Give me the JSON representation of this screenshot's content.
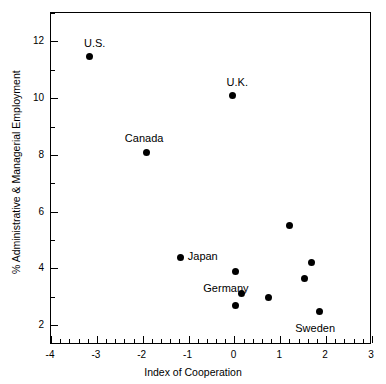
{
  "chart_data": {
    "type": "scatter",
    "title": "",
    "xlabel": "Index of Cooperation",
    "ylabel": "% Administrative & Managerial Employment",
    "xlim": [
      -4,
      3
    ],
    "ylim": [
      1.3,
      13.0
    ],
    "grid": false,
    "legend": "none",
    "x_major_ticks": [
      -4,
      -3,
      -2,
      -1,
      0,
      1,
      2,
      3
    ],
    "x_major_tick_labels": [
      "-4",
      "-3",
      "-2",
      "-1",
      "0",
      "1",
      "2",
      "3"
    ],
    "x_minor_tick_step": 0.2,
    "y_major_ticks": [
      2,
      4,
      6,
      8,
      10,
      12
    ],
    "y_major_tick_labels": [
      "2",
      "4",
      "6",
      "8",
      "10",
      "12"
    ],
    "y_minor_ticks": [
      3,
      5,
      7,
      9,
      11,
      13
    ],
    "marker": "filled-circle",
    "marker_color": "#000000",
    "points": [
      {
        "x": -3.15,
        "y": 11.45,
        "label": "U.S.",
        "label_dx": -6,
        "label_dy": -20
      },
      {
        "x": -0.04,
        "y": 10.08,
        "label": "U.K.",
        "label_dx": -6,
        "label_dy": -20
      },
      {
        "x": -1.91,
        "y": 8.1,
        "label": "Canada",
        "label_dx": -22,
        "label_dy": -20
      },
      {
        "x": 1.2,
        "y": 5.5,
        "label": "",
        "label_dx": 0,
        "label_dy": 0
      },
      {
        "x": -1.17,
        "y": 4.4,
        "label": "Japan",
        "label_dx": 7,
        "label_dy": -7
      },
      {
        "x": 1.67,
        "y": 4.2,
        "label": "",
        "label_dx": 0,
        "label_dy": 0
      },
      {
        "x": 0.02,
        "y": 3.9,
        "label": "",
        "label_dx": 0,
        "label_dy": 0
      },
      {
        "x": 1.52,
        "y": 3.66,
        "label": "",
        "label_dx": 0,
        "label_dy": 0
      },
      {
        "x": 0.15,
        "y": 3.1,
        "label": "Germany",
        "label_dx": -38,
        "label_dy": -12
      },
      {
        "x": 0.74,
        "y": 2.96,
        "label": "",
        "label_dx": 0,
        "label_dy": 0
      },
      {
        "x": 0.02,
        "y": 2.68,
        "label": "",
        "label_dx": 0,
        "label_dy": 0
      },
      {
        "x": 1.85,
        "y": 2.47,
        "label": "Sweden",
        "label_dx": -24,
        "label_dy": 10
      }
    ]
  }
}
